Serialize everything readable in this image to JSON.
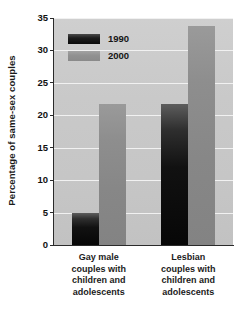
{
  "chart_data": {
    "type": "bar",
    "title": "",
    "subtitle": "",
    "xlabel": "",
    "ylabel": "Percentage of same-sex couples",
    "ylim": [
      0,
      35
    ],
    "ytick_step": 5,
    "yticks": [
      35,
      30,
      25,
      20,
      15,
      10,
      5,
      0
    ],
    "ytick_labels": [
      "35",
      "30",
      "25",
      "20",
      "15",
      "10",
      "5",
      "0"
    ],
    "grid": true,
    "grid_axis": "y",
    "grid_color": "#f1f1f1",
    "legend_position": "upper-left-inside",
    "categories": [
      "Gay male couples with children and adolescents",
      "Lesbian couples with children and adolescents"
    ],
    "category_label_lines": [
      [
        "Gay male",
        "couples with",
        "children and",
        "adolescents"
      ],
      [
        "Lesbian",
        "couples with",
        "children and",
        "adolescents"
      ]
    ],
    "series": [
      {
        "name": "1990",
        "color": "#111111",
        "values": [
          5.0,
          21.7
        ]
      },
      {
        "name": "2000",
        "color": "#8a8a8a",
        "values": [
          21.7,
          33.7
        ]
      }
    ],
    "plot_background": "#c8c8c8",
    "figure_background": "#ffffff",
    "axis_color": "#2a2a2a"
  },
  "legend": {
    "entries": [
      {
        "label": "1990",
        "swatch": "swatch-1990"
      },
      {
        "label": "2000",
        "swatch": "swatch-2000"
      }
    ]
  },
  "axis": {
    "y_title": "Percentage of same-sex couples",
    "ticks": [
      "35",
      "30",
      "25",
      "20",
      "15",
      "10",
      "5",
      "0"
    ]
  }
}
